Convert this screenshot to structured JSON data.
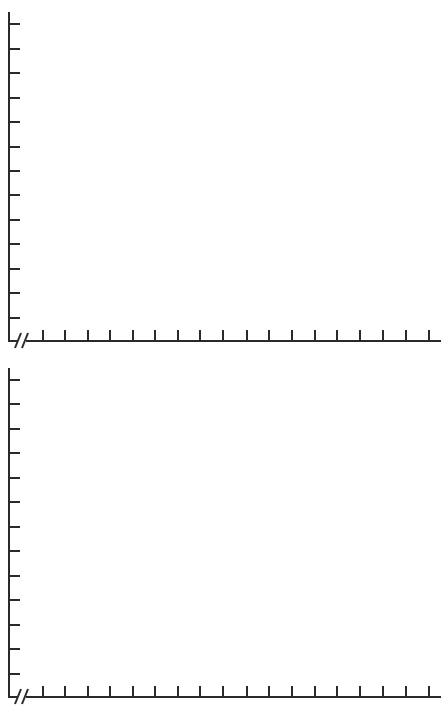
{
  "colors": {
    "background": "#ffffff",
    "axis": "#2a2a2a"
  },
  "chart_data": [
    {
      "type": "line",
      "title": "",
      "xlabel": "",
      "ylabel": "",
      "x": [],
      "series": [],
      "x_ticks": 18,
      "y_ticks": 13,
      "x_tick_labels": [],
      "y_tick_labels": [],
      "axis_break": "x-axis origin (//)",
      "grid": false,
      "legend": null,
      "note": "Blank graph template with no plotted data"
    },
    {
      "type": "line",
      "title": "",
      "xlabel": "",
      "ylabel": "",
      "x": [],
      "series": [],
      "x_ticks": 18,
      "y_ticks": 13,
      "x_tick_labels": [],
      "y_tick_labels": [],
      "axis_break": "x-axis origin (//)",
      "grid": false,
      "legend": null,
      "note": "Blank graph template with no plotted data"
    }
  ],
  "graphs": [
    {
      "top": 0,
      "axis_top_y": 12,
      "baseline_y": 341,
      "y_tick_ys": [
        24,
        49,
        73,
        98,
        122,
        147,
        171,
        195,
        220,
        244,
        269,
        293,
        318
      ],
      "x_tick_xs": [
        43,
        65,
        88,
        110,
        133,
        155,
        178,
        200,
        223,
        247,
        269,
        292,
        315,
        337,
        360,
        383,
        406,
        429
      ],
      "axis_end_x": 441
    },
    {
      "top": 0,
      "axis_top_y": 368,
      "baseline_y": 697,
      "y_tick_ys": [
        380,
        404,
        429,
        453,
        478,
        502,
        527,
        551,
        576,
        600,
        625,
        649,
        674
      ],
      "x_tick_xs": [
        43,
        65,
        88,
        110,
        133,
        155,
        178,
        200,
        223,
        247,
        269,
        292,
        315,
        337,
        360,
        383,
        406,
        429
      ],
      "axis_end_x": 441
    }
  ]
}
